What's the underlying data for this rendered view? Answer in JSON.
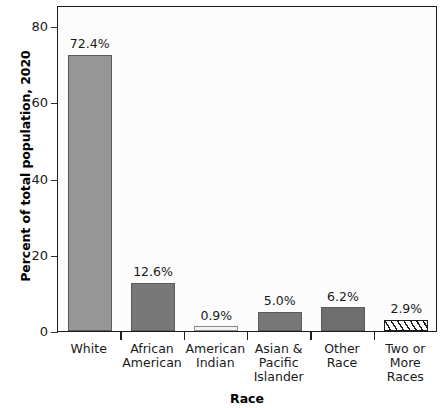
{
  "chart_data": {
    "type": "bar",
    "title": "",
    "xlabel": "Race",
    "ylabel": "Percent of total population, 2020",
    "categories": [
      "White",
      "African American",
      "American Indian",
      "Asian & Pacific Islander",
      "Other Race",
      "Two or More Races"
    ],
    "category_lines": [
      [
        "White"
      ],
      [
        "African",
        "American"
      ],
      [
        "American",
        "Indian"
      ],
      [
        "Asian &",
        "Pacific",
        "Islander"
      ],
      [
        "Other",
        "Race"
      ],
      [
        "Two or",
        "More",
        "Races"
      ]
    ],
    "values": [
      72.4,
      12.6,
      0.9,
      5.0,
      6.2,
      2.9
    ],
    "value_labels": [
      "72.4%",
      "12.6%",
      "0.9%",
      "5.0%",
      "6.2%",
      "2.9%"
    ],
    "bar_fills": [
      "#969696",
      "#787878",
      "#f2f2f2",
      "#787878",
      "#6e6e6e",
      "hatched"
    ],
    "bar_styles": [
      "solid",
      "solid",
      "solid",
      "solid",
      "solid",
      "hatched"
    ],
    "ylim": [
      0,
      84
    ],
    "yticks": [
      0,
      20,
      40,
      60,
      80
    ],
    "ytick_labels": [
      "0",
      "20",
      "40",
      "60",
      "80"
    ],
    "grid": false,
    "legend": "none",
    "plot_background": "#fcfcfc",
    "frame_color": "#1c1c1c"
  }
}
